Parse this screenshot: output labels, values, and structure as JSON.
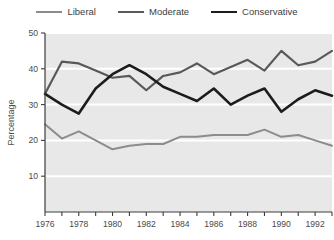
{
  "legend": {
    "position": "top-center",
    "entries": [
      {
        "label": "Liberal",
        "color": "#8c8c8c",
        "width": 2.0,
        "icon": "line-swatch-icon"
      },
      {
        "label": "Moderate",
        "color": "#595959",
        "width": 2.2,
        "icon": "line-swatch-icon"
      },
      {
        "label": "Conservative",
        "color": "#1c1c1c",
        "width": 2.6,
        "icon": "line-swatch-icon"
      }
    ]
  },
  "axes": {
    "ylabel": "Percentage",
    "yticks": [
      10,
      20,
      30,
      40,
      50
    ],
    "ylim": [
      0,
      50
    ],
    "xticks_labeled": [
      1976,
      1978,
      1980,
      1982,
      1984,
      1986,
      1988,
      1990,
      1992
    ],
    "xticks_minor": [
      1977,
      1979,
      1981,
      1983,
      1985,
      1987,
      1989,
      1991,
      1993
    ],
    "xlim": [
      1976,
      1993
    ],
    "xlabel": ""
  },
  "style": {
    "plot_background": "#e8e8e8",
    "gridline_color": "#ffffff",
    "axis_line_color": "#3c3c3c",
    "page_background": "#ffffff"
  },
  "chart_data": {
    "type": "line",
    "title": "",
    "xlabel": "",
    "ylabel": "Percentage",
    "xlim": [
      1976,
      1993
    ],
    "ylim": [
      0,
      50
    ],
    "grid": "horizontal",
    "legend_position": "top-center",
    "x": [
      1976,
      1977,
      1978,
      1979,
      1980,
      1981,
      1982,
      1983,
      1984,
      1985,
      1986,
      1987,
      1988,
      1989,
      1990,
      1991,
      1992,
      1993
    ],
    "series": [
      {
        "name": "Liberal",
        "color": "#8c8c8c",
        "values": [
          24.5,
          20.5,
          22.5,
          20.0,
          17.5,
          18.5,
          19.0,
          19.0,
          21.0,
          21.0,
          21.5,
          21.5,
          21.5,
          23.0,
          21.0,
          21.5,
          20.0,
          18.5
        ]
      },
      {
        "name": "Moderate",
        "color": "#595959",
        "values": [
          33.0,
          42.0,
          41.5,
          39.5,
          37.5,
          38.0,
          34.0,
          38.0,
          39.0,
          41.5,
          38.5,
          40.5,
          42.5,
          39.5,
          45.0,
          41.0,
          42.0,
          45.0
        ]
      },
      {
        "name": "Conservative",
        "color": "#1c1c1c",
        "values": [
          33.0,
          30.0,
          27.5,
          34.5,
          38.5,
          41.0,
          38.5,
          35.0,
          33.0,
          31.0,
          34.5,
          30.0,
          32.5,
          34.5,
          28.0,
          31.5,
          34.0,
          32.5
        ]
      }
    ]
  }
}
